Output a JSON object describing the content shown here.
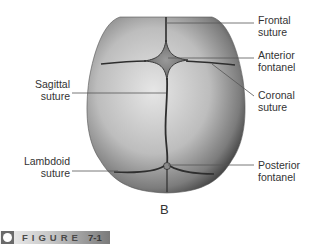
{
  "figure": {
    "panel_letter": "B",
    "badge_label": "FIGURE",
    "badge_number": "7-1"
  },
  "labels": {
    "frontal_suture": [
      "Frontal",
      "suture"
    ],
    "anterior_fontanel": [
      "Anterior",
      "fontanel"
    ],
    "coronal_suture": [
      "Coronal",
      "suture"
    ],
    "sagittal_suture": [
      "Sagittal",
      "suture"
    ],
    "lambdoid_suture": [
      "Lambdoid",
      "suture"
    ],
    "posterior_fontanel": [
      "Posterior",
      "fontanel"
    ]
  },
  "colors": {
    "skull_light": "#d9d9d9",
    "skull_dark": "#4a4a4a",
    "suture": "#2e2e2e",
    "leader_line": "#555555",
    "text": "#333333"
  }
}
